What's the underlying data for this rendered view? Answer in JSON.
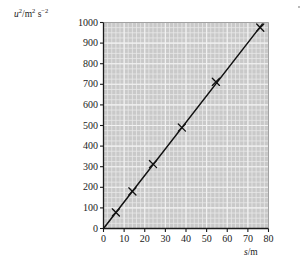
{
  "chart_data": {
    "type": "scatter",
    "title": "",
    "xlabel": "s/m",
    "ylabel": "u2/m2 s-2",
    "xlabel_parts": {
      "symbol": "s",
      "unit": "/m"
    },
    "ylabel_parts": {
      "symbol": "u",
      "symbol_exp": "2",
      "unit_num": "/m",
      "unit_num_exp": "2",
      "unit_den": " s",
      "unit_den_exp": "−2"
    },
    "xlim": [
      0,
      80
    ],
    "ylim": [
      0,
      1000
    ],
    "xticks": [
      0,
      10,
      20,
      30,
      40,
      50,
      60,
      70,
      80
    ],
    "yticks": [
      0,
      100,
      200,
      300,
      400,
      500,
      600,
      700,
      800,
      900,
      1000
    ],
    "xtick_labels": [
      "0",
      "10",
      "20",
      "30",
      "40",
      "50",
      "60",
      "70",
      "80"
    ],
    "ytick_labels": [
      "0",
      "100",
      "200",
      "300",
      "400",
      "500",
      "600",
      "700",
      "800",
      "900",
      "1000"
    ],
    "grid": true,
    "grid_minor_step_x": 2,
    "grid_minor_step_y": 25,
    "legend": false,
    "marker": "x",
    "points": [
      {
        "x": 6,
        "y": 78
      },
      {
        "x": 14,
        "y": 180
      },
      {
        "x": 24,
        "y": 313
      },
      {
        "x": 38,
        "y": 490
      },
      {
        "x": 54.5,
        "y": 712
      },
      {
        "x": 76,
        "y": 975
      }
    ],
    "x": [
      6,
      14,
      24,
      38,
      54.5,
      76
    ],
    "values": [
      78,
      180,
      313,
      490,
      712,
      975
    ],
    "fit_line": {
      "type": "line-of-best-fit",
      "x_start": 0,
      "y_start": 0,
      "x_end": 77,
      "y_end": 992,
      "slope": 12.9,
      "intercept": 0
    },
    "colors": {
      "plot_background": "#c9c9c9",
      "grid_minor": "#e8e8e8",
      "grid_major": "#f2f2f2",
      "axis": "#1a1a1a",
      "data": "#111111",
      "page_background": "#ffffff"
    }
  }
}
